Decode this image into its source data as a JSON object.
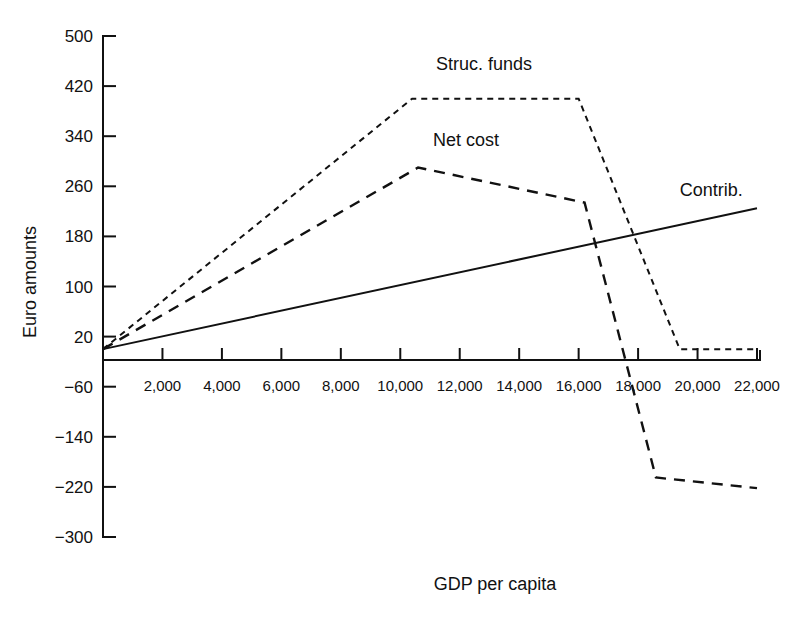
{
  "chart_data": {
    "type": "line",
    "title": "",
    "xlabel": "GDP per capita",
    "ylabel": "Euro amounts",
    "xlim": [
      0,
      22000
    ],
    "ylim": [
      -300,
      500
    ],
    "grid": false,
    "legend_position": "inline-annotations",
    "x_ticks": [
      "2,000",
      "4,000",
      "6,000",
      "8,000",
      "10,000",
      "12,000",
      "14,000",
      "16,000",
      "18,000",
      "20,000",
      "22,000"
    ],
    "x_tick_values": [
      2000,
      4000,
      6000,
      8000,
      10000,
      12000,
      14000,
      16000,
      18000,
      20000,
      22000
    ],
    "y_ticks": [
      "500",
      "420",
      "340",
      "260",
      "180",
      "100",
      "20",
      "−60",
      "−140",
      "−220",
      "−300"
    ],
    "y_tick_values": [
      500,
      420,
      340,
      260,
      180,
      100,
      20,
      -60,
      -140,
      -220,
      -300
    ],
    "series": [
      {
        "name": "Struc. funds",
        "style": "dotted",
        "label_text": "Struc. funds",
        "points": [
          {
            "x": 0,
            "y": 0
          },
          {
            "x": 10400,
            "y": 400
          },
          {
            "x": 16000,
            "y": 400
          },
          {
            "x": 19400,
            "y": 0
          },
          {
            "x": 22000,
            "y": 0
          }
        ]
      },
      {
        "name": "Net cost",
        "style": "dashed",
        "label_text": "Net cost",
        "points": [
          {
            "x": 0,
            "y": 0
          },
          {
            "x": 10600,
            "y": 290
          },
          {
            "x": 16200,
            "y": 234
          },
          {
            "x": 18600,
            "y": -205
          },
          {
            "x": 22000,
            "y": -222
          }
        ]
      },
      {
        "name": "Contrib.",
        "style": "solid",
        "label_text": "Contrib.",
        "points": [
          {
            "x": 0,
            "y": 0
          },
          {
            "x": 22000,
            "y": 225
          }
        ]
      }
    ],
    "annotations": [
      {
        "text": "Struc. funds",
        "x": 11200,
        "y": 445
      },
      {
        "text": "Net cost",
        "x": 11100,
        "y": 325
      },
      {
        "text": "Contrib.",
        "x": 19400,
        "y": 245
      }
    ]
  }
}
